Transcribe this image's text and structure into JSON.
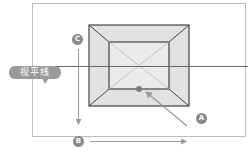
{
  "diagram": {
    "labels": {
      "horizon": "视平线",
      "a": "A",
      "b": "B",
      "c": "C"
    },
    "colors": {
      "frame": "#bdbdbd",
      "box_stroke": "#444444",
      "box_fill": "#e2e2e2",
      "inner_fill": "#ebebeb",
      "horizon": "#666666",
      "diagonal": "#b8b8b8",
      "arrow": "#9a9a9a",
      "badge": "#8a8a8a",
      "dot": "#7a7a7a"
    },
    "geometry": {
      "frame": {
        "x": 32,
        "y": 3,
        "w": 214,
        "h": 134
      },
      "outer_box": {
        "x": 89,
        "y": 25,
        "w": 100,
        "h": 81
      },
      "inner_box": {
        "x": 109,
        "y": 42,
        "w": 60,
        "h": 47
      },
      "horizon_y": 66,
      "vanishing_dot": {
        "x": 139,
        "y": 89
      }
    }
  }
}
